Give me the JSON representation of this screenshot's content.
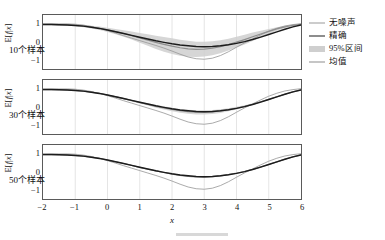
{
  "chart_data": {
    "type": "line",
    "title": "",
    "xlabel": "x",
    "ylabel": "E[f|x]",
    "xlim": [
      -2,
      6
    ],
    "ylim": [
      -1.55,
      1.55
    ],
    "xticks": [
      -2,
      -1,
      0,
      1,
      2,
      3,
      4,
      5,
      6
    ],
    "xticklabels": [
      "−2",
      "−1",
      "0",
      "1",
      "2",
      "3",
      "4",
      "5",
      "6"
    ],
    "yticks": [
      1,
      0,
      -1
    ],
    "yticklabels": [
      "1",
      "0",
      "−1"
    ],
    "grid": true,
    "legend_position": "right-outside",
    "colors": {
      "noiseless": "#9a9a9a",
      "exact": "#1c1c1c",
      "interval": "#cfcfcf",
      "mean": "#8d8d8d",
      "frame": "#5a5a5a",
      "grid": "#d2d2d2",
      "text": "#111111"
    },
    "x": [
      -2.0,
      -1.75,
      -1.5,
      -1.25,
      -1.0,
      -0.75,
      -0.5,
      -0.25,
      0.0,
      0.25,
      0.5,
      0.75,
      1.0,
      1.25,
      1.5,
      1.75,
      2.0,
      2.25,
      2.5,
      2.75,
      3.0,
      3.25,
      3.5,
      3.75,
      4.0,
      4.25,
      4.5,
      4.75,
      5.0,
      5.25,
      5.5,
      5.75,
      6.0
    ],
    "panels": [
      {
        "label": "10个样本",
        "n_samples": 10,
        "series": [
          {
            "name": "无噪声",
            "key": "noiseless",
            "values": [
              1.02,
              1.03,
              1.04,
              1.04,
              1.02,
              0.97,
              0.89,
              0.78,
              0.65,
              0.51,
              0.36,
              0.22,
              0.08,
              -0.06,
              -0.2,
              -0.35,
              -0.52,
              -0.7,
              -0.86,
              -0.96,
              -0.99,
              -0.93,
              -0.78,
              -0.56,
              -0.3,
              -0.05,
              0.18,
              0.41,
              0.62,
              0.79,
              0.92,
              1.0,
              1.05
            ]
          },
          {
            "name": "精确",
            "key": "exact",
            "values": [
              1.0,
              1.0,
              0.99,
              0.98,
              0.95,
              0.91,
              0.85,
              0.78,
              0.69,
              0.59,
              0.49,
              0.38,
              0.27,
              0.17,
              0.07,
              -0.02,
              -0.1,
              -0.17,
              -0.22,
              -0.26,
              -0.27,
              -0.26,
              -0.22,
              -0.16,
              -0.08,
              0.02,
              0.14,
              0.28,
              0.43,
              0.58,
              0.73,
              0.87,
              0.98
            ]
          },
          {
            "name": "均值",
            "key": "mean",
            "values": [
              1.01,
              1.01,
              1.0,
              0.99,
              0.96,
              0.92,
              0.86,
              0.79,
              0.7,
              0.6,
              0.49,
              0.37,
              0.24,
              0.11,
              -0.02,
              -0.14,
              -0.24,
              -0.33,
              -0.39,
              -0.42,
              -0.41,
              -0.36,
              -0.27,
              -0.15,
              -0.01,
              0.14,
              0.3,
              0.46,
              0.61,
              0.75,
              0.87,
              0.96,
              1.02
            ]
          }
        ],
        "interval": {
          "name": "95%区间",
          "key": "interval",
          "lower": [
            0.96,
            0.96,
            0.95,
            0.93,
            0.9,
            0.85,
            0.78,
            0.69,
            0.58,
            0.45,
            0.3,
            0.14,
            -0.04,
            -0.22,
            -0.4,
            -0.56,
            -0.69,
            -0.79,
            -0.85,
            -0.86,
            -0.83,
            -0.76,
            -0.64,
            -0.49,
            -0.32,
            -0.14,
            0.06,
            0.27,
            0.47,
            0.65,
            0.8,
            0.91,
            0.98
          ],
          "upper": [
            1.06,
            1.06,
            1.05,
            1.05,
            1.02,
            0.99,
            0.94,
            0.89,
            0.82,
            0.75,
            0.68,
            0.6,
            0.52,
            0.44,
            0.36,
            0.28,
            0.21,
            0.13,
            0.07,
            0.02,
            0.01,
            0.04,
            0.1,
            0.19,
            0.3,
            0.42,
            0.54,
            0.65,
            0.75,
            0.85,
            0.94,
            1.01,
            1.06
          ]
        }
      },
      {
        "label": "30个样本",
        "n_samples": 30,
        "series": [
          {
            "name": "无噪声",
            "key": "noiseless",
            "values": [
              1.02,
              1.03,
              1.04,
              1.04,
              1.02,
              0.97,
              0.89,
              0.78,
              0.65,
              0.51,
              0.36,
              0.22,
              0.08,
              -0.06,
              -0.2,
              -0.35,
              -0.52,
              -0.7,
              -0.86,
              -0.96,
              -0.99,
              -0.93,
              -0.78,
              -0.56,
              -0.3,
              -0.05,
              0.18,
              0.41,
              0.62,
              0.79,
              0.92,
              1.0,
              1.05
            ]
          },
          {
            "name": "精确",
            "key": "exact",
            "values": [
              1.0,
              1.0,
              0.99,
              0.98,
              0.95,
              0.91,
              0.85,
              0.78,
              0.69,
              0.59,
              0.49,
              0.38,
              0.27,
              0.17,
              0.07,
              -0.02,
              -0.1,
              -0.17,
              -0.22,
              -0.26,
              -0.27,
              -0.26,
              -0.22,
              -0.16,
              -0.08,
              0.02,
              0.14,
              0.28,
              0.43,
              0.58,
              0.73,
              0.87,
              0.98
            ]
          },
          {
            "name": "均值",
            "key": "mean",
            "values": [
              1.0,
              1.0,
              0.99,
              0.98,
              0.95,
              0.91,
              0.85,
              0.78,
              0.69,
              0.59,
              0.48,
              0.37,
              0.26,
              0.15,
              0.04,
              -0.05,
              -0.14,
              -0.21,
              -0.27,
              -0.3,
              -0.3,
              -0.28,
              -0.23,
              -0.16,
              -0.07,
              0.04,
              0.16,
              0.3,
              0.44,
              0.59,
              0.73,
              0.87,
              0.99
            ]
          }
        ],
        "interval": {
          "name": "95%区间",
          "key": "interval",
          "lower": [
            0.99,
            0.99,
            0.98,
            0.96,
            0.93,
            0.89,
            0.83,
            0.75,
            0.66,
            0.55,
            0.44,
            0.32,
            0.2,
            0.08,
            -0.04,
            -0.15,
            -0.25,
            -0.33,
            -0.39,
            -0.43,
            -0.43,
            -0.4,
            -0.34,
            -0.25,
            -0.14,
            -0.01,
            0.12,
            0.26,
            0.41,
            0.56,
            0.71,
            0.85,
            0.97
          ],
          "upper": [
            1.01,
            1.01,
            1.0,
            0.99,
            0.97,
            0.93,
            0.87,
            0.81,
            0.72,
            0.63,
            0.52,
            0.42,
            0.32,
            0.22,
            0.12,
            0.04,
            -0.04,
            -0.11,
            -0.16,
            -0.19,
            -0.19,
            -0.17,
            -0.13,
            -0.07,
            0.01,
            0.1,
            0.21,
            0.34,
            0.47,
            0.61,
            0.75,
            0.88,
            1.0
          ]
        }
      },
      {
        "label": "50个样本",
        "n_samples": 50,
        "series": [
          {
            "name": "无噪声",
            "key": "noiseless",
            "values": [
              1.02,
              1.03,
              1.04,
              1.04,
              1.02,
              0.97,
              0.89,
              0.78,
              0.65,
              0.51,
              0.36,
              0.22,
              0.08,
              -0.06,
              -0.2,
              -0.35,
              -0.52,
              -0.7,
              -0.86,
              -0.96,
              -0.99,
              -0.93,
              -0.78,
              -0.56,
              -0.3,
              -0.05,
              0.18,
              0.41,
              0.62,
              0.79,
              0.92,
              1.0,
              1.05
            ]
          },
          {
            "name": "精确",
            "key": "exact",
            "values": [
              1.0,
              1.0,
              0.99,
              0.98,
              0.95,
              0.91,
              0.85,
              0.78,
              0.69,
              0.59,
              0.49,
              0.38,
              0.27,
              0.17,
              0.07,
              -0.02,
              -0.1,
              -0.17,
              -0.22,
              -0.26,
              -0.27,
              -0.26,
              -0.22,
              -0.16,
              -0.08,
              0.02,
              0.14,
              0.28,
              0.43,
              0.58,
              0.73,
              0.87,
              0.98
            ]
          },
          {
            "name": "均值",
            "key": "mean",
            "values": [
              1.0,
              1.0,
              0.99,
              0.98,
              0.95,
              0.91,
              0.85,
              0.78,
              0.69,
              0.59,
              0.49,
              0.38,
              0.27,
              0.16,
              0.06,
              -0.03,
              -0.12,
              -0.19,
              -0.25,
              -0.28,
              -0.29,
              -0.27,
              -0.22,
              -0.15,
              -0.07,
              0.03,
              0.15,
              0.29,
              0.43,
              0.58,
              0.73,
              0.87,
              0.98
            ]
          }
        ],
        "interval": {
          "name": "95%区间",
          "key": "interval",
          "lower": [
            0.995,
            0.995,
            0.985,
            0.975,
            0.945,
            0.905,
            0.845,
            0.775,
            0.685,
            0.585,
            0.482,
            0.372,
            0.262,
            0.152,
            0.048,
            -0.042,
            -0.132,
            -0.204,
            -0.262,
            -0.294,
            -0.304,
            -0.284,
            -0.234,
            -0.164,
            -0.084,
            0.016,
            0.136,
            0.276,
            0.416,
            0.566,
            0.716,
            0.856,
            0.975
          ],
          "upper": [
            1.005,
            1.005,
            0.995,
            0.985,
            0.955,
            0.915,
            0.855,
            0.785,
            0.695,
            0.595,
            0.498,
            0.388,
            0.278,
            0.168,
            0.072,
            -0.018,
            -0.108,
            -0.176,
            -0.238,
            -0.266,
            -0.276,
            -0.256,
            -0.206,
            -0.136,
            -0.056,
            0.044,
            0.164,
            0.304,
            0.444,
            0.594,
            0.744,
            0.884,
            0.985
          ]
        }
      }
    ],
    "legend": [
      {
        "label": "无噪声",
        "type": "line",
        "key": "noiseless"
      },
      {
        "label": "精确",
        "type": "line",
        "key": "exact"
      },
      {
        "label": "95%区间",
        "type": "patch",
        "key": "interval"
      },
      {
        "label": "均值",
        "type": "line",
        "key": "mean"
      }
    ]
  }
}
